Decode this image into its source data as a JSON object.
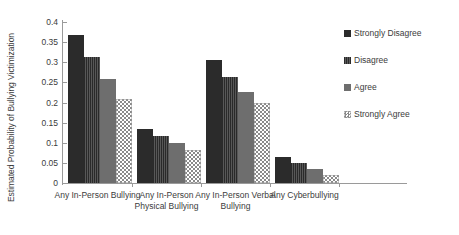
{
  "chart_data": {
    "type": "bar",
    "title": "",
    "xlabel": "",
    "ylabel": "Estimated Probability of Bullying Victimization",
    "ylim": [
      0,
      0.4
    ],
    "yticks": [
      "0",
      "0.05",
      "0.1",
      "0.15",
      "0.2",
      "0.25",
      "0.3",
      "0.35",
      "0.4"
    ],
    "ytick_values": [
      0,
      0.05,
      0.1,
      0.15,
      0.2,
      0.25,
      0.3,
      0.35,
      0.4
    ],
    "grid": false,
    "legend_position": "right",
    "categories": [
      "Any In-Person Bullying",
      "Any In-Person Physical Bullying",
      "Any In-Person Verbal Bullying",
      "Any Cyberbullying"
    ],
    "category_lines": [
      [
        "Any In-Person Bullying"
      ],
      [
        "Any In-Person",
        "Physical Bullying"
      ],
      [
        "Any In-Person Verbal",
        "Bullying"
      ],
      [
        "Any Cyberbullying"
      ]
    ],
    "series": [
      {
        "name": "Strongly Disagree",
        "pattern": "solid-dark",
        "color": "#2b2b2b",
        "values": [
          0.368,
          0.135,
          0.305,
          0.065
        ]
      },
      {
        "name": "Disagree",
        "pattern": "vertical-stripes-dark",
        "color": "#3a3a3a",
        "values": [
          0.312,
          0.117,
          0.263,
          0.05
        ]
      },
      {
        "name": "Agree",
        "pattern": "solid-gray",
        "color": "#6e6e6e",
        "values": [
          0.258,
          0.1,
          0.227,
          0.035
        ]
      },
      {
        "name": "Strongly Agree",
        "pattern": "checkerboard",
        "color": "#8a8a8a",
        "values": [
          0.208,
          0.082,
          0.198,
          0.02
        ]
      }
    ]
  },
  "legend": {
    "items": [
      {
        "label": "Strongly Disagree"
      },
      {
        "label": "Disagree"
      },
      {
        "label": "Agree"
      },
      {
        "label": "Strongly Agree"
      }
    ]
  }
}
